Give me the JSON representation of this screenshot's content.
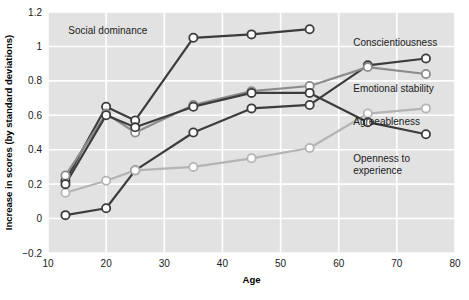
{
  "chart_data": {
    "type": "line",
    "title": "",
    "subtitle": "",
    "xlabel": "Age",
    "ylabel": "Increase in scores (by standard deviations)",
    "xlim": [
      10,
      80
    ],
    "ylim": [
      -0.2,
      1.2
    ],
    "xticks": [
      "10",
      "20",
      "30",
      "40",
      "50",
      "60",
      "70",
      "80"
    ],
    "xtick_values": [
      10,
      20,
      30,
      40,
      50,
      60,
      70,
      80
    ],
    "yticks": [
      "1.2",
      "1",
      "0.8",
      "0.6",
      "0.4",
      "0.2",
      "0",
      "−0.2"
    ],
    "ytick_values": [
      1.2,
      1.0,
      0.8,
      0.6,
      0.4,
      0.2,
      0.0,
      -0.2
    ],
    "grid": true,
    "grid_color": "#ffffff",
    "plot_background": "#e2e2e2",
    "legend_position": "inline-right",
    "marker": "open-circle",
    "x": [
      13,
      20,
      25,
      35,
      45,
      55,
      65,
      75
    ],
    "series": [
      {
        "name": "Social dominance",
        "color": "#3c3c3c",
        "x": [
          13,
          20,
          25,
          35,
          45,
          55
        ],
        "values": [
          0.22,
          0.65,
          0.57,
          1.05,
          1.07,
          1.1
        ],
        "label_x": 13.5,
        "label_y": 1.075,
        "label_anchor": "start"
      },
      {
        "name": "Conscientiousness",
        "color": "#3c3c3c",
        "x": [
          13,
          20,
          25,
          35,
          45,
          55,
          65,
          75
        ],
        "values": [
          0.02,
          0.06,
          0.28,
          0.5,
          0.64,
          0.66,
          0.89,
          0.93
        ],
        "label_x": 62.5,
        "label_y": 1.0,
        "label_anchor": "start"
      },
      {
        "name": "Emotional stability",
        "color": "#8c8c8c",
        "x": [
          13,
          20,
          25,
          35,
          45,
          55,
          65,
          75
        ],
        "values": [
          0.25,
          0.61,
          0.5,
          0.66,
          0.74,
          0.77,
          0.88,
          0.84
        ],
        "label_x": 62.5,
        "label_y": 0.735,
        "label_anchor": "start"
      },
      {
        "name": "Agreeableness",
        "color": "#b4b4b4",
        "x": [
          13,
          20,
          25,
          35,
          45,
          55,
          65,
          75
        ],
        "values": [
          0.15,
          0.22,
          0.28,
          0.3,
          0.35,
          0.41,
          0.61,
          0.64
        ],
        "label_x": 62.5,
        "label_y": 0.545,
        "label_anchor": "start"
      },
      {
        "name": "Openness to experience",
        "color": "#3c3c3c",
        "x": [
          13,
          20,
          25,
          35,
          45,
          55,
          65,
          75
        ],
        "values": [
          0.2,
          0.6,
          0.53,
          0.65,
          0.73,
          0.73,
          0.56,
          0.49
        ],
        "label_lines": [
          "Openness to",
          "experience"
        ],
        "label_x": 62.5,
        "label_y": 0.33,
        "label_anchor": "start"
      }
    ]
  }
}
